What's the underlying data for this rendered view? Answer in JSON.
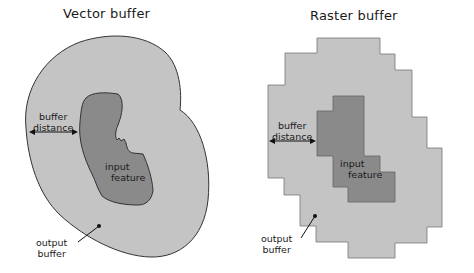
{
  "colors": {
    "background": "#ffffff",
    "buffer_fill": "#c4c4c4",
    "feature_fill": "#8a8a8a",
    "outline": "#333333",
    "text": "#1a1a1a"
  },
  "panels": [
    {
      "title": "Vector buffer",
      "labels": {
        "buffer_distance": [
          "buffer",
          "distance"
        ],
        "input_feature": [
          "input",
          "feature"
        ],
        "output_buffer": [
          "output",
          "buffer"
        ]
      }
    },
    {
      "title": "Raster buffer",
      "labels": {
        "buffer_distance": [
          "buffer",
          "distance"
        ],
        "input_feature": [
          "input",
          "feature"
        ],
        "output_buffer": [
          "output",
          "buffer"
        ]
      }
    }
  ]
}
